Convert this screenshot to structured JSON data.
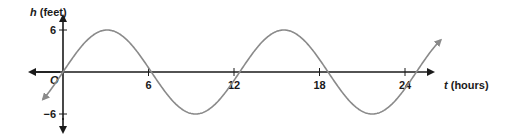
{
  "chart_data": {
    "type": "line",
    "title": "",
    "xlabel_var": "t",
    "xlabel_unit": "(hours)",
    "ylabel_var": "h",
    "ylabel_unit": "(feet)",
    "origin_label": "O",
    "x_ticks": [
      6,
      12,
      18,
      24
    ],
    "y_ticks": [
      6,
      -6
    ],
    "y_tick_labels": [
      "6",
      "−6"
    ],
    "xlim": [
      -1.4,
      32
    ],
    "ylim": [
      -6.5,
      6.5
    ],
    "series": [
      {
        "name": "h(t)",
        "function": "6 sin(2π t / 12.4)",
        "amplitude": 6,
        "period": 12.4,
        "t_range": [
          -1.4,
          26.5
        ]
      }
    ],
    "colors": {
      "axis": "#1a1a1a",
      "curve": "#8a8a8a"
    },
    "grid": false
  }
}
